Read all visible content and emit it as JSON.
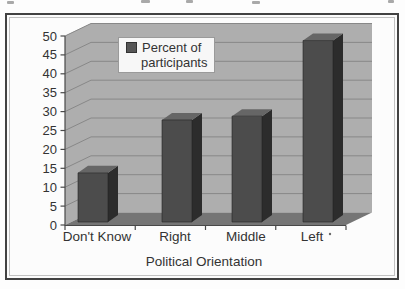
{
  "chart_data": {
    "type": "bar",
    "style": "3d-column-grayscale-scan",
    "categories": [
      "Don't Know",
      "Right",
      "Middle",
      "Left"
    ],
    "values": [
      13,
      27,
      28,
      48
    ],
    "series": [
      {
        "name": "Percent of participants",
        "values": [
          13,
          27,
          28,
          48
        ]
      }
    ],
    "title": "",
    "xlabel": "Political Orientation",
    "ylabel": "",
    "ylim": [
      0,
      50
    ],
    "ytick_step": 5,
    "yticks": [
      0,
      5,
      10,
      15,
      20,
      25,
      30,
      35,
      40,
      45,
      50
    ],
    "grid": true,
    "legend_position": "top-center"
  },
  "legend": {
    "line1": "Percent of",
    "line2": "participants"
  },
  "artifacts": {
    "left_category_trailing_dot": "·",
    "top_edge_text_fragments": "partial glyphs cut off at top of scan"
  },
  "colors": {
    "bar_front": "#4c4c4c",
    "bar_side": "#2c2c2c",
    "bar_top": "#666666",
    "wall": "#aeaeae",
    "wall_top": "#9c9c9c",
    "floor": "#757575",
    "gridline": "#888888",
    "axis_line": "#484848",
    "text": "#333333",
    "panel_border": "#424242",
    "legend_bg": "#f7f7f7"
  }
}
